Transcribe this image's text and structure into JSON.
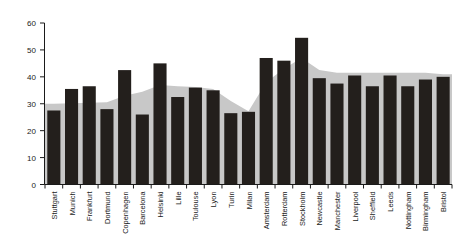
{
  "chart_data": {
    "type": "bar",
    "title": "",
    "subtitle": "",
    "xlabel": "",
    "ylabel": "",
    "ylim": [
      0,
      60
    ],
    "yticks": [
      0,
      10,
      20,
      30,
      40,
      50,
      60
    ],
    "ytick_labels": [
      "0",
      "10",
      "20",
      "30",
      "40",
      "50",
      "60"
    ],
    "grid": false,
    "legend": "none",
    "categories": [
      "Stuttgart",
      "Munich",
      "Frankfurt",
      "Dortmund",
      "Copenhagen",
      "Barcelona",
      "Helsinki",
      "Lille",
      "Toulouse",
      "Lyon",
      "Turin",
      "Milan",
      "Amsterdam",
      "Rotterdam",
      "Stockholm",
      "Newcastle",
      "Manchester",
      "Liverpool",
      "Sheffield",
      "Leeds",
      "Nottingham",
      "Birmingham",
      "Bristol"
    ],
    "series": [
      {
        "name": "bars",
        "render": "bar",
        "color": "#231f1c",
        "values": [
          27.5,
          35.5,
          36.5,
          28.0,
          42.5,
          26.0,
          45.0,
          32.5,
          36.0,
          35.0,
          26.5,
          27.0,
          47.0,
          46.0,
          54.5,
          39.5,
          37.5,
          40.5,
          36.5,
          40.5,
          36.5,
          39.0,
          40.0
        ]
      },
      {
        "name": "background-area",
        "render": "area",
        "color": "#c8c8c8",
        "values": [
          30.0,
          30.2,
          30.4,
          30.6,
          33.0,
          34.5,
          37.0,
          36.5,
          36.2,
          35.5,
          31.0,
          27.2,
          38.0,
          43.0,
          47.0,
          42.5,
          41.5,
          41.5,
          41.5,
          41.5,
          41.5,
          41.5,
          41.0
        ]
      }
    ]
  },
  "axis": {
    "y_axis_name": "value-axis",
    "x_axis_name": "category-axis"
  }
}
